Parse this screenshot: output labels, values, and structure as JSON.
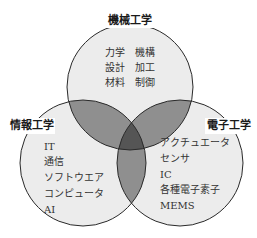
{
  "diagram": {
    "type": "venn",
    "colors": {
      "single": "#ececec",
      "double": "#8f8f8f",
      "triple": "#555555",
      "stroke": "#2a2a2a"
    },
    "sets": {
      "top": {
        "title": "機械工学",
        "items": [
          "力学",
          "機構",
          "設計",
          "加工",
          "材料",
          "制御"
        ]
      },
      "left": {
        "title": "情報工学",
        "items": [
          "IT",
          "通信",
          "ソフトウエア",
          "コンピュータ",
          "AI"
        ]
      },
      "right": {
        "title": "電子工学",
        "items": [
          "アクチュエータ",
          "センサ",
          "IC",
          "各種電子素子",
          "MEMS"
        ]
      }
    }
  }
}
